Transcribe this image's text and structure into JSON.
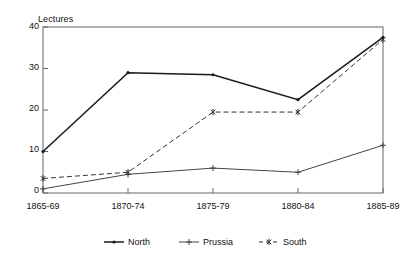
{
  "chart_data": {
    "type": "line",
    "title": "Lectures",
    "xlabel": "",
    "ylabel": "Lectures",
    "categories": [
      "1865-69",
      "1870-74",
      "1875-79",
      "1880-84",
      "1885-89"
    ],
    "ylim": [
      0,
      40
    ],
    "yticks": [
      0,
      10,
      20,
      30,
      40
    ],
    "grid": false,
    "legend_position": "bottom",
    "series": [
      {
        "name": "North",
        "values": [
          10,
          29,
          28.5,
          22.5,
          37.5
        ],
        "line_style": "solid",
        "marker": "dot",
        "color": "#1a1a1a"
      },
      {
        "name": "Prussia",
        "values": [
          1,
          4.5,
          6,
          5,
          11.5
        ],
        "line_style": "solid",
        "marker": "plus",
        "color": "#444444"
      },
      {
        "name": "South",
        "values": [
          3.5,
          5,
          19.5,
          19.5,
          37
        ],
        "line_style": "dashed",
        "marker": "asterisk",
        "color": "#333333"
      }
    ]
  },
  "axis": {
    "y_labels": [
      "40",
      "30",
      "20",
      "10",
      "0"
    ],
    "x_labels": [
      "1865-69",
      "1870-74",
      "1875-79",
      "1880-84",
      "1885-89"
    ],
    "title_label": "Lectures"
  },
  "legend": {
    "entries": [
      {
        "label": "North",
        "marker": "dot-marker",
        "style": "solid"
      },
      {
        "label": "Prussia",
        "marker": "plus-marker",
        "style": "solid"
      },
      {
        "label": "South",
        "marker": "asterisk-marker",
        "style": "dashed"
      }
    ]
  },
  "colors": {
    "frame": "#555555",
    "north": "#1a1a1a",
    "prussia": "#555555",
    "south": "#333333",
    "background": "#ffffff"
  }
}
